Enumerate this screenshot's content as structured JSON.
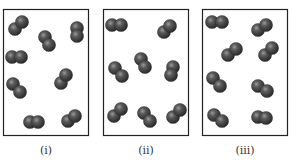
{
  "figure": {
    "colors": {
      "box_border": "#222222",
      "atom_dark": "#2e2e2e",
      "atom_mid": "#555555",
      "atom_highlight": "#9a9a9a",
      "label": "#333333"
    },
    "panels": [
      {
        "label": "(i)",
        "molecule_count": 8
      },
      {
        "label": "(ii)",
        "molecule_count": 8
      },
      {
        "label": "(iii)",
        "molecule_count": 8
      }
    ]
  }
}
